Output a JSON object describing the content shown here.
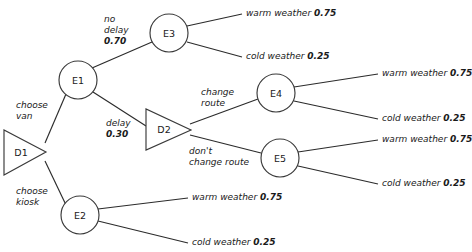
{
  "diagram": {
    "type": "decision-tree",
    "nodes": [
      {
        "id": "D1",
        "label": "D1",
        "kind": "decision",
        "shape": "triangle",
        "cx": 24,
        "cy": 152
      },
      {
        "id": "E1",
        "label": "E1",
        "kind": "chance",
        "shape": "circle",
        "cx": 78,
        "cy": 80
      },
      {
        "id": "E2",
        "label": "E2",
        "kind": "chance",
        "shape": "circle",
        "cx": 80,
        "cy": 215
      },
      {
        "id": "E3",
        "label": "E3",
        "kind": "chance",
        "shape": "circle",
        "cx": 169,
        "cy": 33
      },
      {
        "id": "D2",
        "label": "D2",
        "kind": "decision",
        "shape": "triangle",
        "cx": 166,
        "cy": 129
      },
      {
        "id": "E4",
        "label": "E4",
        "kind": "chance",
        "shape": "circle",
        "cx": 276,
        "cy": 93
      },
      {
        "id": "E5",
        "label": "E5",
        "kind": "chance",
        "shape": "circle",
        "cx": 280,
        "cy": 158
      }
    ],
    "branch_labels": {
      "choose_van": {
        "line1": "choose",
        "line2": "van"
      },
      "choose_kiosk": {
        "line1": "choose",
        "line2": "kiosk"
      },
      "no_delay": {
        "line1": "no",
        "line2": "delay",
        "prob": "0.70"
      },
      "delay": {
        "line1": "delay",
        "prob": "0.30"
      },
      "change_route": {
        "line1": "change",
        "line2": "route"
      },
      "dont_change_route": {
        "line1": "don't",
        "line2": "change route"
      }
    },
    "outcomes": {
      "warm": {
        "text": "warm weather",
        "prob": "0.75"
      },
      "cold": {
        "text": "cold weather",
        "prob": "0.25"
      }
    },
    "leaves": [
      {
        "parent": "E3",
        "outcome": "warm weather",
        "prob": "0.75"
      },
      {
        "parent": "E3",
        "outcome": "cold weather",
        "prob": "0.25"
      },
      {
        "parent": "E4",
        "outcome": "warm weather",
        "prob": "0.75"
      },
      {
        "parent": "E4",
        "outcome": "cold weather",
        "prob": "0.25"
      },
      {
        "parent": "E5",
        "outcome": "warm weather",
        "prob": "0.75"
      },
      {
        "parent": "E5",
        "outcome": "cold weather",
        "prob": "0.25"
      },
      {
        "parent": "E2",
        "outcome": "warm weather",
        "prob": "0.75"
      },
      {
        "parent": "E2",
        "outcome": "cold weather",
        "prob": "0.25"
      }
    ],
    "colors": {
      "stroke": "#2b2b2b",
      "text": "#1a1a1a",
      "background": "#ffffff"
    }
  }
}
